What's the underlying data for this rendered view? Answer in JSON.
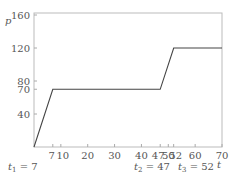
{
  "chart_data": {
    "type": "line",
    "title": "",
    "xlabel": "t",
    "ylabel": "p",
    "xlim": [
      0,
      70
    ],
    "ylim": [
      0,
      160
    ],
    "grid": false,
    "legend": null,
    "x": [
      0,
      7,
      47,
      52,
      70
    ],
    "series": [
      {
        "name": "p(t)",
        "values": [
          0,
          70,
          70,
          120,
          120
        ]
      }
    ],
    "x_ticks": [
      7,
      10,
      20,
      30,
      40,
      47,
      50,
      52,
      60,
      70
    ],
    "x_tick_labels": [
      "7",
      "10",
      "20",
      "30",
      "40",
      "47",
      "50",
      "52",
      "60",
      "70"
    ],
    "y_ticks": [
      40,
      70,
      80,
      120,
      160
    ],
    "y_tick_labels": [
      "40",
      "70",
      "80",
      "120",
      "160"
    ],
    "annotations": [
      {
        "text_var": "t",
        "sub": "1",
        "text_rest": " = 7",
        "x": 7
      },
      {
        "text_var": "t",
        "sub": "2",
        "text_rest": " = 47",
        "x": 47
      },
      {
        "text_var": "t",
        "sub": "3",
        "text_rest": " = 52",
        "x": 52
      }
    ]
  }
}
